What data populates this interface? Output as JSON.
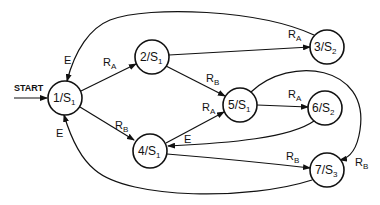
{
  "diagram": {
    "start_label": "START",
    "nodes": [
      {
        "id": "1",
        "main": "1/S",
        "sub": "1",
        "cx": 65,
        "cy": 98
      },
      {
        "id": "2",
        "main": "2/S",
        "sub": "1",
        "cx": 152,
        "cy": 57
      },
      {
        "id": "3",
        "main": "3/S",
        "sub": "2",
        "cx": 327,
        "cy": 47
      },
      {
        "id": "4",
        "main": "4/S",
        "sub": "1",
        "cx": 150,
        "cy": 151
      },
      {
        "id": "5",
        "main": "5/S",
        "sub": "1",
        "cx": 240,
        "cy": 105
      },
      {
        "id": "6",
        "main": "6/S",
        "sub": "2",
        "cx": 325,
        "cy": 108
      },
      {
        "id": "7",
        "main": "7/S",
        "sub": "3",
        "cx": 327,
        "cy": 170
      }
    ],
    "edges": [
      {
        "from": "1",
        "to": "2",
        "label": "R",
        "sub": "A"
      },
      {
        "from": "1",
        "to": "4",
        "label": "R",
        "sub": "B"
      },
      {
        "from": "2",
        "to": "3",
        "label": "R",
        "sub": "A"
      },
      {
        "from": "2",
        "to": "5",
        "label": "R",
        "sub": "B"
      },
      {
        "from": "4",
        "to": "5",
        "label": "R",
        "sub": "A"
      },
      {
        "from": "4",
        "to": "7",
        "label": "R",
        "sub": "B"
      },
      {
        "from": "5",
        "to": "6",
        "label": "R",
        "sub": "A"
      },
      {
        "from": "5",
        "to": "7",
        "label": "R",
        "sub": "B"
      },
      {
        "from": "6",
        "to": "4",
        "label": "E",
        "sub": ""
      },
      {
        "from": "3",
        "to": "1",
        "label": "E",
        "sub": ""
      },
      {
        "from": "7",
        "to": "1",
        "label": "E",
        "sub": ""
      }
    ]
  }
}
